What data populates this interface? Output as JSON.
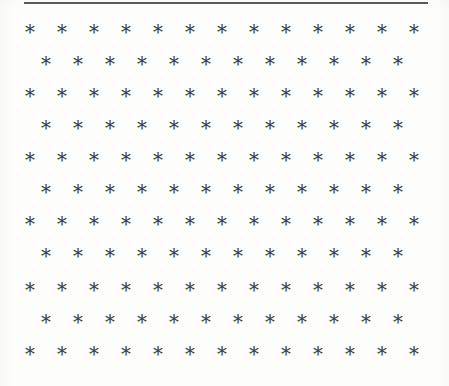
{
  "page": {
    "kind": "scanned-document-page",
    "background_color": "#fdfdfc",
    "width": 449,
    "height": 386
  },
  "top_rule": {
    "name": "horizontal-rule",
    "color": "#4c4c4c",
    "left": 24,
    "top": 2,
    "width": 404,
    "height": 2
  },
  "glyph_field": {
    "glyph": "*",
    "glyph_name": "asterisk",
    "color": "#3b3b3f",
    "font_size_px": 20,
    "pattern": "staggered-quincunx-grid",
    "row_count": 11,
    "row_spacing_px": 32,
    "column_spacing_px": 32,
    "odd_row_start_x": 30,
    "even_row_start_x": 46,
    "first_row_y": 32,
    "rows": [
      {
        "index": 1,
        "y": 32,
        "start_x": 30,
        "count": 13,
        "offset": false
      },
      {
        "index": 2,
        "y": 64,
        "start_x": 46,
        "count": 12,
        "offset": true
      },
      {
        "index": 3,
        "y": 96,
        "start_x": 30,
        "count": 13,
        "offset": false
      },
      {
        "index": 4,
        "y": 128,
        "start_x": 46,
        "count": 12,
        "offset": true
      },
      {
        "index": 5,
        "y": 160,
        "start_x": 30,
        "count": 13,
        "offset": false
      },
      {
        "index": 6,
        "y": 192,
        "start_x": 46,
        "count": 12,
        "offset": true
      },
      {
        "index": 7,
        "y": 224,
        "start_x": 30,
        "count": 13,
        "offset": false
      },
      {
        "index": 8,
        "y": 256,
        "start_x": 46,
        "count": 12,
        "offset": true
      },
      {
        "index": 9,
        "y": 290,
        "start_x": 30,
        "count": 13,
        "offset": false
      },
      {
        "index": 10,
        "y": 322,
        "start_x": 46,
        "count": 12,
        "offset": true
      },
      {
        "index": 11,
        "y": 354,
        "start_x": 30,
        "count": 13,
        "offset": false
      }
    ],
    "total_glyph_count": 137
  }
}
